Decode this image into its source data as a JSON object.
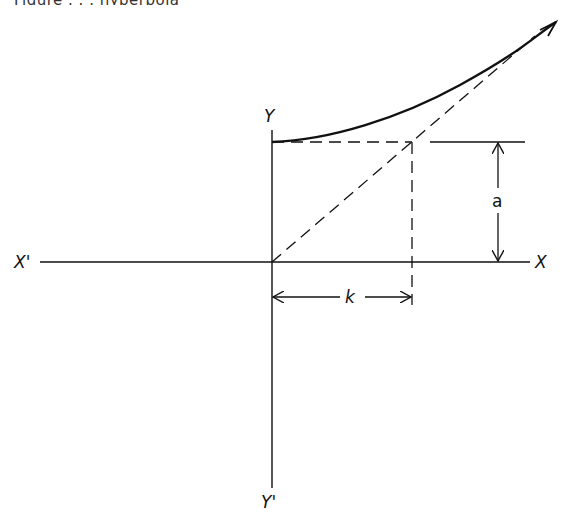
{
  "caption": {
    "text": "Figure . . . hyperbola"
  },
  "diagram": {
    "type": "geometric construction",
    "axes": {
      "x_positive_label": "X",
      "x_negative_label": "X'",
      "y_positive_label": "Y",
      "y_negative_label": "Y'"
    },
    "dimensions": {
      "vertical_label": "a",
      "horizontal_label": "k"
    },
    "colors": {
      "stroke": "#111111",
      "background": "#ffffff"
    }
  }
}
